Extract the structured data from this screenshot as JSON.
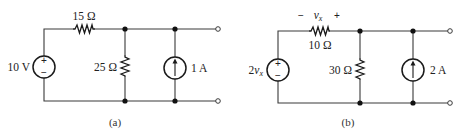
{
  "circuits": [
    {
      "caption": "(a)",
      "voltage_source": {
        "label": "10 V",
        "polarity_top": "+",
        "polarity_bottom": "−"
      },
      "series_resistor": {
        "label": "15 Ω"
      },
      "shunt_resistor": {
        "label": "25 Ω"
      },
      "current_source": {
        "label": "1 A",
        "direction": "up"
      }
    },
    {
      "caption": "(b)",
      "voltage_source": {
        "label_coef": "2",
        "label_var": "v",
        "label_sub": "x",
        "type": "dependent",
        "polarity_top": "+",
        "polarity_bottom": "−"
      },
      "series_resistor": {
        "label": "10 Ω",
        "voltage_var": "v",
        "voltage_sub": "x",
        "minus": "−",
        "plus": "+"
      },
      "shunt_resistor": {
        "label": "30 Ω"
      },
      "current_source": {
        "label": "2 A",
        "direction": "up"
      }
    }
  ]
}
